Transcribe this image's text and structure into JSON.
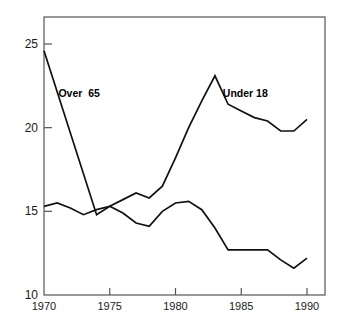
{
  "chart_data": {
    "type": "line",
    "title": "",
    "subtitle": "",
    "xlabel": "",
    "ylabel": "",
    "xlim": [
      1970,
      1990
    ],
    "ylim": [
      10,
      26
    ],
    "grid": false,
    "legend_position": "inline-annotations",
    "x_ticks": [
      1970,
      1975,
      1980,
      1985,
      1990
    ],
    "x_tick_labels": [
      "1970",
      "1975",
      "1980",
      "1985",
      "1990"
    ],
    "y_ticks": [
      10,
      15,
      20,
      25
    ],
    "y_tick_labels": [
      "10",
      "15",
      "20",
      "25"
    ],
    "x": [
      1970,
      1971,
      1972,
      1973,
      1974,
      1975,
      1976,
      1977,
      1978,
      1979,
      1980,
      1981,
      1982,
      1983,
      1984,
      1985,
      1986,
      1987,
      1988,
      1989,
      1990
    ],
    "series": [
      {
        "name": "Over  65",
        "label_x": 1971.1,
        "label_y": 22.1,
        "values": [
          24.6,
          null,
          null,
          null,
          14.8,
          15.3,
          14.9,
          14.3,
          14.1,
          15.0,
          15.5,
          15.6,
          15.1,
          14.0,
          12.7,
          12.7,
          12.7,
          12.7,
          12.1,
          11.6,
          12.2
        ]
      },
      {
        "name": "Under 18",
        "label_x": 1983.6,
        "label_y": 22.1,
        "values": [
          15.3,
          15.5,
          15.2,
          14.8,
          15.1,
          15.3,
          15.7,
          16.1,
          15.8,
          16.5,
          18.2,
          20.0,
          21.6,
          23.1,
          21.4,
          21.0,
          20.6,
          20.4,
          19.8,
          19.8,
          20.5
        ]
      }
    ],
    "annotations": [
      {
        "text": "Over  65",
        "x": 1971.1,
        "y": 22.1
      },
      {
        "text": "Under 18",
        "x": 1983.6,
        "y": 22.1
      }
    ],
    "line_color": "#111111",
    "frame_color": "#555555"
  },
  "plot": {
    "left_px": 44,
    "right_px": 325,
    "top_px": 17,
    "bottom_px": 295
  }
}
